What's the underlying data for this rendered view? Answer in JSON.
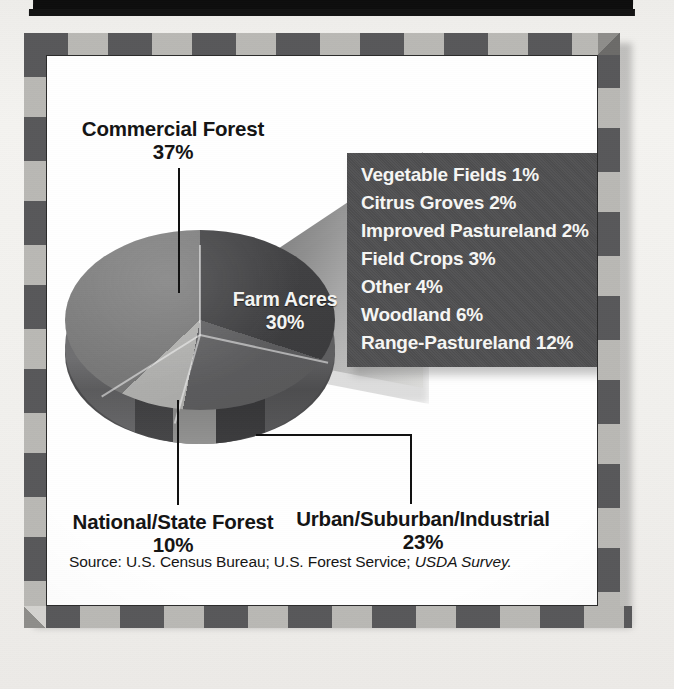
{
  "figure": {
    "source_prefix": "Source:  U.S. Census Bureau; U.S. Forest Service; ",
    "source_italic": "USDA Survey."
  },
  "labels": {
    "commercial_forest": {
      "name": "Commercial Forest",
      "pct": "37%"
    },
    "farm_acres": {
      "name": "Farm Acres",
      "pct": "30%"
    },
    "national_state_forest": {
      "name": "National/State Forest",
      "pct": "10%"
    },
    "urban_suburban_industrial": {
      "name": "Urban/Suburban/Industrial",
      "pct": "23%"
    }
  },
  "legend": {
    "items": [
      "Vegetable Fields 1%",
      "Citrus Groves 2%",
      "Improved Pastureland 2%",
      "Field Crops 3%",
      "Other 4%",
      "Woodland 6%",
      "Range-Pastureland 12%"
    ]
  },
  "colors": {
    "frame_dark": "#58585a",
    "frame_light": "#b9b8b4",
    "legend_bg": "#4f4f51",
    "slice_farm": "#3e3e40",
    "slice_urban": "#606062",
    "slice_national": "#b8b8b6",
    "slice_commercial": "#7c7c7c",
    "pie_side": "#58585a",
    "plate_bg": "#ffffff",
    "text_dark": "#141414",
    "text_light": "#f6f6f4"
  },
  "chart_data": {
    "type": "pie",
    "title": "",
    "subtitle": "",
    "xlabel": "",
    "ylabel": "",
    "legend_position": "right",
    "grid": false,
    "units": "percent",
    "categories": [
      "Commercial Forest",
      "Farm Acres",
      "Urban/Suburban/Industrial",
      "National/State Forest"
    ],
    "values": [
      37,
      30,
      23,
      10
    ],
    "slices": [
      {
        "label": "Commercial Forest",
        "value": 37,
        "display": "37%",
        "color": "#7c7c7c",
        "label_placement": "outside-left",
        "leader": true
      },
      {
        "label": "Farm Acres",
        "value": 30,
        "display": "30%",
        "color": "#3e3e40",
        "label_placement": "inside",
        "leader": false
      },
      {
        "label": "Urban/Suburban/Industrial",
        "value": 23,
        "display": "23%",
        "color": "#606062",
        "label_placement": "outside-bottom",
        "leader": true
      },
      {
        "label": "National/State Forest",
        "value": 10,
        "display": "10%",
        "color": "#b8b8b6",
        "label_placement": "outside-bottom",
        "leader": true
      }
    ],
    "breakout": {
      "of_slice": "Farm Acres",
      "categories": [
        "Vegetable Fields",
        "Citrus Groves",
        "Improved Pastureland",
        "Field Crops",
        "Other",
        "Woodland",
        "Range-Pastureland"
      ],
      "values": [
        1,
        2,
        2,
        3,
        4,
        6,
        12
      ],
      "displays": [
        "1%",
        "2%",
        "2%",
        "3%",
        "4%",
        "6%",
        "12%"
      ]
    },
    "annotations": [
      "Source:  U.S. Census Bureau; U.S. Forest Service; USDA Survey."
    ]
  }
}
